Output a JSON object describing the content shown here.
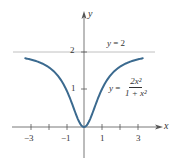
{
  "chart_data": {
    "type": "line",
    "title": "",
    "xlabel": "x",
    "ylabel": "y",
    "xlim": [
      -3.9,
      4.2
    ],
    "ylim": [
      -0.9,
      3.4
    ],
    "x_ticks": [
      -3,
      -2,
      -1,
      1,
      2,
      3
    ],
    "x_tick_labels": [
      "-3",
      "-1",
      "1",
      "3"
    ],
    "y_ticks": [
      1,
      2
    ],
    "y_tick_labels": [
      "1",
      "2"
    ],
    "grid": false,
    "series": [
      {
        "name": "y = 2x^2/(1+x^2)",
        "function": "2*x^2/(1+x^2)",
        "x": [
          -3.3,
          -3,
          -2.5,
          -2,
          -1.5,
          -1,
          -0.5,
          0,
          0.5,
          1,
          1.5,
          2,
          2.5,
          3,
          3.3
        ],
        "values": [
          1.83,
          1.8,
          1.72,
          1.6,
          1.38,
          1.0,
          0.4,
          0,
          0.4,
          1.0,
          1.38,
          1.6,
          1.72,
          1.8,
          1.83
        ],
        "color": "#3b6a8f"
      },
      {
        "name": "y = 2",
        "x": [
          -3.9,
          3.9
        ],
        "values": [
          2,
          2
        ],
        "color": "#aaaaaa",
        "style": "asymptote"
      }
    ],
    "annotations": [
      {
        "text": "y = 2",
        "x": 1.5,
        "y": 2.3
      },
      {
        "text": "y = 2x^2 / (1 + x^2)",
        "x": 2.4,
        "y": 0.95
      }
    ]
  },
  "labels": {
    "y_axis": "y",
    "x_axis": "x",
    "asymptote_lhs": "y",
    "asymptote_eq": " = 2",
    "curve_lhs": "y",
    "curve_eq": " =",
    "curve_num": "2x²",
    "curve_den": "1 + x²",
    "tick_x_m3": "−3",
    "tick_x_m1": "−1",
    "tick_x_1": "1",
    "tick_x_3": "3",
    "tick_y_1": "1",
    "tick_y_2": "2"
  },
  "colors": {
    "curve": "#3b6a8f",
    "axis": "#555555",
    "asymptote": "#b0b0b0"
  }
}
